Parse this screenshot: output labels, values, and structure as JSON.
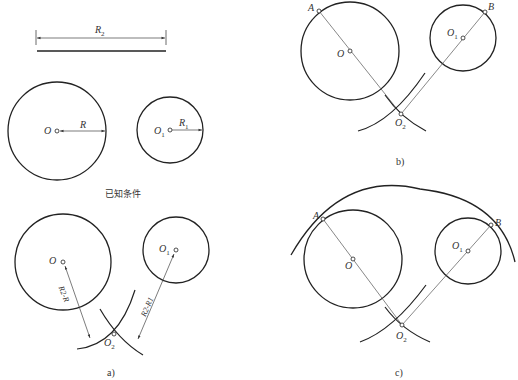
{
  "figure": {
    "known_conditions": {
      "caption": "已知条件",
      "labels": {
        "R2": "R",
        "R2_sub": "2",
        "O": "O",
        "R": "R",
        "O1": "O",
        "O1_sub": "1",
        "R1": "R",
        "R1_sub": "1"
      }
    },
    "panel_a": {
      "caption": "a)",
      "labels": {
        "O": "O",
        "O1": "O",
        "O1_sub": "1",
        "O2": "O",
        "O2_sub": "2",
        "dim_left": "R2-R",
        "dim_right": "R2-R1"
      }
    },
    "panel_b": {
      "caption": "b)",
      "labels": {
        "A": "A",
        "B": "B",
        "O": "O",
        "O1": "O",
        "O1_sub": "1",
        "O2": "O",
        "O2_sub": "2"
      }
    },
    "panel_c": {
      "caption": "c)",
      "labels": {
        "A": "A",
        "B": "B",
        "O": "O",
        "O1": "O",
        "O1_sub": "1",
        "O2": "O",
        "O2_sub": "2"
      }
    }
  },
  "colors": {
    "stroke": "#222222",
    "thin": "#555555",
    "background": "#ffffff"
  }
}
